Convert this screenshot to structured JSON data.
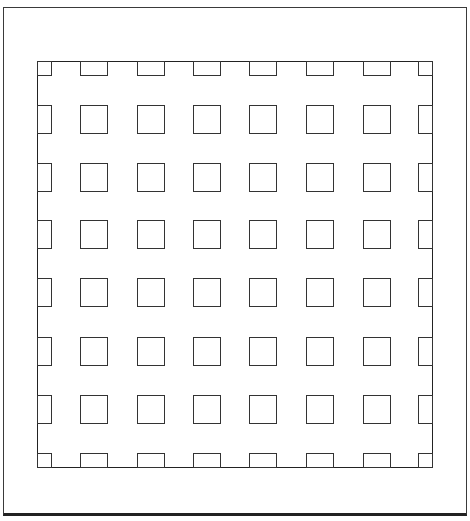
{
  "figure": {
    "line_color": "#2a2a2a",
    "background": "#ffffff",
    "outer_frame": {
      "left": 3,
      "top": 7,
      "right": 467,
      "bottom": 516
    },
    "inner_frame": {
      "left": 37,
      "top": 61,
      "right": 433,
      "bottom": 468
    },
    "grid": {
      "columns": [
        80,
        137,
        193,
        249,
        306,
        363
      ],
      "rows": [
        105,
        163,
        220,
        278,
        337,
        395
      ],
      "cell_width": 28,
      "cell_height": 29,
      "edge_cell_depth": 15
    }
  }
}
